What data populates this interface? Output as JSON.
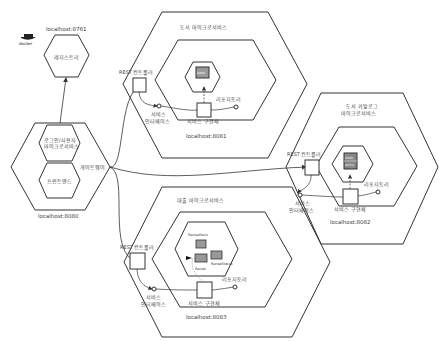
{
  "diagram": {
    "type": "hexagonal-microservice-architecture",
    "registry": {
      "label": "레지스트리",
      "host": "localhost:8761",
      "badge": "docker"
    },
    "gateway": {
      "label": "게이트웨이",
      "host": "localhost:8080",
      "inner": [
        "로그인/사용자\n마이크로서비스",
        "프런트엔드"
      ],
      "inner_line1": "로그인/사용자",
      "inner_line2": "마이크로서비스",
      "inner_frontend": "프런트엔드"
    },
    "services": [
      {
        "title": "도서 마이크로서비스",
        "host": "localhost:8081",
        "controller": "REST 컨트롤러",
        "interface_l1": "서비스",
        "interface_l2": "인터페이스",
        "impl": "서비스 구현체",
        "repository": "리포지토리",
        "entities": [
          "book"
        ]
      },
      {
        "title_l1": "도서 카탈로그",
        "title_l2": "마이크로서비스",
        "host": "localhost:8082",
        "controller": "REST 컨트롤러",
        "interface_l1": "서비스",
        "interface_l2": "인터페이스",
        "impl": "서비스 구현체",
        "repository": "리포지토리",
        "entities": [
          "book",
          "entry"
        ]
      },
      {
        "title": "대출 마이크로서비스",
        "host": "localhost:8083",
        "controller": "REST 컨트롤러",
        "interface_l1": "서비스",
        "interface_l2": "인터페이스",
        "impl": "서비스 구현체",
        "repository": "리포지토리",
        "entities": [
          "RentedItem",
          "Rental",
          "RentalStatus"
        ]
      }
    ],
    "colors": {
      "stroke": "#333333",
      "entity_fill": "#9a9a9a",
      "entity_stroke": "#444444",
      "background": "#ffffff"
    }
  }
}
